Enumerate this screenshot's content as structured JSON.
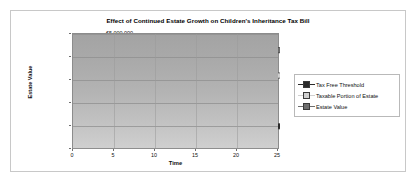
{
  "chart_data": {
    "type": "line",
    "title": "Effect of Continued Estate Growth on Children's Inheritance Tax Bill",
    "xlabel": "Time",
    "ylabel": "Estate Value",
    "x": [
      0,
      5,
      10,
      15,
      20,
      25
    ],
    "xtick_labels": [
      "0",
      "5",
      "10",
      "15",
      "20",
      "25"
    ],
    "xlim": [
      0,
      25
    ],
    "ylim": [
      0,
      5000000
    ],
    "ytick_labels": [
      "€5,000,000",
      "€4,000,000",
      "€3,000,000",
      "€2,000,000",
      "€1,000,000",
      "€0"
    ],
    "ytick_values": [
      5000000,
      4000000,
      3000000,
      2000000,
      1000000,
      0
    ],
    "grid": true,
    "legend_position": "right",
    "plot_background": "#b0b0b0",
    "series": [
      {
        "name": "Tax Free Threshold",
        "color": "#2b2b2b",
        "marker": "square",
        "values": [
          500000,
          560000,
          640000,
          730000,
          860000,
          1020000
        ]
      },
      {
        "name": "Taxable Portion of Estate",
        "color": "#d0d0d0",
        "marker": "square",
        "values": [
          490000,
          750000,
          1130000,
          1620000,
          2280000,
          3210000
        ]
      },
      {
        "name": "Estate Value",
        "color": "#6e6e6e",
        "marker": "square",
        "values": [
          1000000,
          1320000,
          1780000,
          2360000,
          3160000,
          4300000
        ]
      }
    ]
  },
  "legend": {
    "items": [
      {
        "label": "Tax Free Threshold",
        "color": "#2b2b2b"
      },
      {
        "label": "Taxable Portion of Estate",
        "color": "#d0d0d0"
      },
      {
        "label": "Estate Value",
        "color": "#6e6e6e"
      }
    ]
  }
}
